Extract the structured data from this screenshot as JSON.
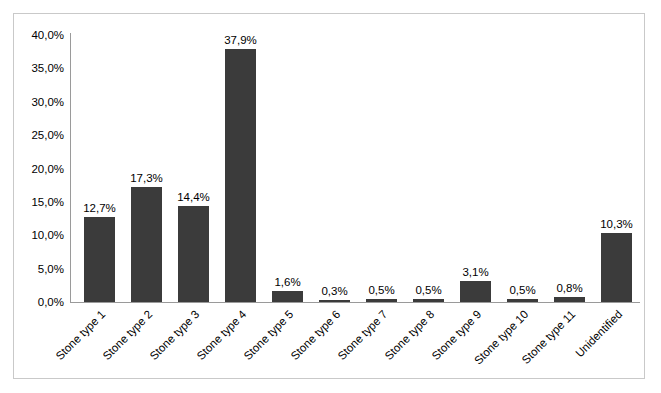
{
  "chart_data": {
    "type": "bar",
    "title": "",
    "subtitle": "",
    "xlabel": "",
    "ylabel": "",
    "categories": [
      "Stone type 1",
      "Stone type 2",
      "Stone type 3",
      "Stone type 4",
      "Stone type 5",
      "Stone type 6",
      "Stone type 7",
      "Stone type 8",
      "Stone type 9",
      "Stone type 10",
      "Stone type 11",
      "Unidentified"
    ],
    "values": [
      12.7,
      17.3,
      14.4,
      37.9,
      1.6,
      0.3,
      0.5,
      0.5,
      3.1,
      0.5,
      0.8,
      10.3
    ],
    "data_labels": [
      "12,7%",
      "17,3%",
      "14,4%",
      "37,9%",
      "1,6%",
      "0,3%",
      "0,5%",
      "0,5%",
      "3,1%",
      "0,5%",
      "0,8%",
      "10,3%"
    ],
    "ylim": [
      0,
      40
    ],
    "ytick_values": [
      0,
      5,
      10,
      15,
      20,
      25,
      30,
      35,
      40
    ],
    "ytick_labels": [
      "0,0%",
      "5,0%",
      "10,0%",
      "15,0%",
      "20,0%",
      "25,0%",
      "30,0%",
      "35,0%",
      "40,0%"
    ],
    "grid": false,
    "legend": false,
    "legend_position": "none",
    "bar_color": "#3b3b3b",
    "axis_color": "#9a9a9a",
    "frame_color": "#c9c9c9",
    "label_rotation": -45
  }
}
